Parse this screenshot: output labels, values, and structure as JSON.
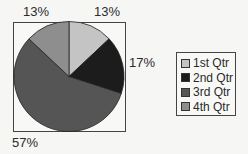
{
  "chart_data": {
    "type": "pie",
    "title": "",
    "categories": [
      "1st Qtr",
      "2nd Qtr",
      "3rd Qtr",
      "4th Qtr"
    ],
    "values": [
      13,
      17,
      57,
      13
    ],
    "value_labels": [
      "13%",
      "17%",
      "57%",
      "13%"
    ],
    "colors": [
      "#c4c4c4",
      "#1c1c1c",
      "#555555",
      "#8e8e8e"
    ],
    "start_angle": "12 o'clock",
    "direction": "clockwise",
    "legend_position": "right",
    "plot_border": true
  },
  "labels": {
    "q1": "13%",
    "q2": "17%",
    "q3": "57%",
    "q4": "13%"
  },
  "legend": {
    "items": [
      {
        "label": "1st Qtr",
        "color": "#c4c4c4"
      },
      {
        "label": "2nd Qtr",
        "color": "#1c1c1c"
      },
      {
        "label": "3rd Qtr",
        "color": "#555555"
      },
      {
        "label": "4th Qtr",
        "color": "#8e8e8e"
      }
    ]
  }
}
